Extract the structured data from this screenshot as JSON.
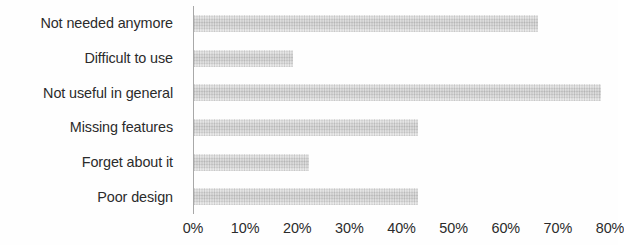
{
  "chart_data": {
    "type": "bar",
    "orientation": "horizontal",
    "title": "",
    "subtitle": "",
    "xlabel": "",
    "ylabel": "",
    "categories": [
      "Not needed anymore",
      "Difficult to use",
      "Not useful in general",
      "Missing features",
      "Forget about it",
      "Poor design"
    ],
    "values": [
      66,
      19,
      78,
      43,
      22,
      43
    ],
    "value_suffix": "%",
    "xlim": [
      0,
      80
    ],
    "xticks": [
      0,
      10,
      20,
      30,
      40,
      50,
      60,
      70,
      80
    ],
    "xtick_labels": [
      "0%",
      "10%",
      "20%",
      "30%",
      "40%",
      "50%",
      "60%",
      "70%",
      "80%"
    ],
    "grid": false,
    "legend": false,
    "legend_position": "none",
    "series": [
      {
        "name": "",
        "values": [
          66,
          19,
          78,
          43,
          22,
          43
        ]
      }
    ],
    "colors": {
      "bar_fill": "#d4d4d4",
      "bar_fill_light": "#f0f0f0",
      "axis_line": "#a8a8a8",
      "text": "#2b2b2b",
      "background": "#fefefe"
    }
  }
}
